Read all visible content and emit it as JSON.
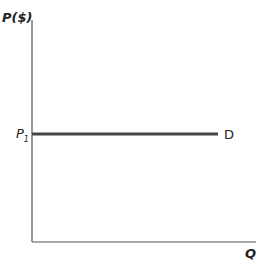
{
  "chart_data": {
    "type": "line",
    "title": "",
    "xlabel": "Q",
    "ylabel": "P($)",
    "xlim": [
      0,
      1
    ],
    "ylim": [
      0,
      1
    ],
    "grid": false,
    "y_tick_labels": [
      {
        "label": "P",
        "subscript": "1",
        "value": 0.5
      }
    ],
    "series": [
      {
        "name": "D",
        "color": "#444444",
        "points": [
          {
            "x": 0,
            "y": 0.5
          },
          {
            "x": 0.85,
            "y": 0.5
          }
        ]
      }
    ],
    "axis_color": "#555555"
  }
}
